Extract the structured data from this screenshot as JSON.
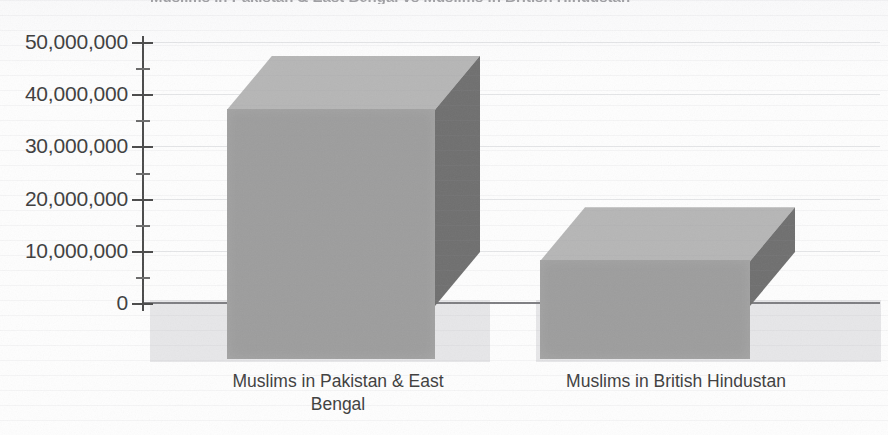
{
  "chart_data": {
    "type": "bar",
    "variant": "3d-column",
    "title": "",
    "title_partial_cropped": "Muslims in Pakistan & East Bengal vs Muslims in British Hindustan",
    "categories": [
      "Muslims in Pakistan & East Bengal",
      "Muslims in British Hindustan"
    ],
    "category_lines": [
      [
        "Muslims in Pakistan & East",
        "Bengal"
      ],
      [
        "Muslims in British Hindustan",
        ""
      ]
    ],
    "values": [
      37000000,
      8000000
    ],
    "xlabel": "",
    "ylabel": "",
    "ylim": [
      0,
      50000000
    ],
    "y_major_step": 10000000,
    "y_minor_step": 5000000,
    "y_tick_labels": [
      "50,000,000",
      "40,000,000",
      "30,000,000",
      "20,000,000",
      "10,000,000",
      "0"
    ],
    "y_tick_values": [
      50000000,
      40000000,
      30000000,
      20000000,
      10000000,
      0
    ],
    "grid": true,
    "legend": false,
    "legend_position": "none",
    "series": [
      {
        "name": "Muslim population",
        "values": [
          37000000,
          8000000
        ]
      }
    ]
  },
  "colors": {
    "bar_front": "#9d9d9d",
    "bar_top": "#b6b6b6",
    "bar_side": "#6f6f6f",
    "axis": "#4a4a4a",
    "text": "#3d3d3d",
    "gridline": "#aaacb4",
    "background": "#fefefe",
    "floor_shadow": "#cdcdd0"
  }
}
